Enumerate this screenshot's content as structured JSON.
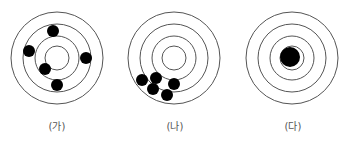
{
  "targets": [
    {
      "label": "(가)",
      "center": [
        57,
        58
      ],
      "ring_radii": [
        46,
        34,
        22,
        12
      ],
      "hits": [
        [
          53,
          31
        ],
        [
          29,
          51
        ],
        [
          86,
          58
        ],
        [
          45,
          69
        ],
        [
          57,
          85
        ]
      ],
      "hit_radius": 6
    },
    {
      "label": "(나)",
      "center": [
        174,
        58
      ],
      "ring_radii": [
        46,
        34,
        22,
        12
      ],
      "hits": [
        [
          142,
          80
        ],
        [
          156,
          78
        ],
        [
          174,
          84
        ],
        [
          153,
          89
        ],
        [
          167,
          95
        ]
      ],
      "hit_radius": 6
    },
    {
      "label": "(다)",
      "center": [
        292,
        58
      ],
      "ring_radii": [
        46,
        34,
        22,
        12
      ],
      "hits": [
        [
          290,
          57
        ]
      ],
      "hit_radius": 10
    }
  ],
  "colors": {
    "ring": "#555555",
    "hit": "#000000",
    "label": "#555555"
  }
}
